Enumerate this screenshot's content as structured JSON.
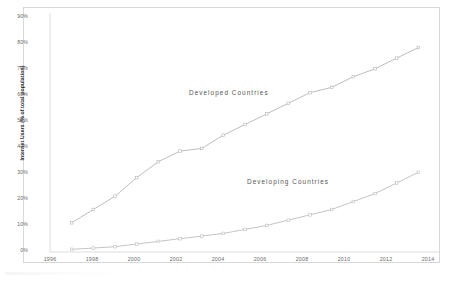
{
  "chart_data": {
    "type": "line",
    "title": "",
    "xlabel": "",
    "ylabel": "Internet Users (% of total population)",
    "xlim": [
      1996,
      2014
    ],
    "ylim": [
      0,
      90
    ],
    "grid": false,
    "legend_position": "inline-annotations",
    "xticks": [
      "1996",
      "1998",
      "2000",
      "2002",
      "2004",
      "2006",
      "2008",
      "2010",
      "2012",
      "2014"
    ],
    "yticks": [
      "0%",
      "10%",
      "20%",
      "30%",
      "40%",
      "50%",
      "60%",
      "70%",
      "80%",
      "90%"
    ],
    "x": [
      1997,
      1998,
      1999,
      2000,
      2001,
      2002,
      2003,
      2004,
      2005,
      2006,
      2007,
      2008,
      2009,
      2010,
      2011,
      2012,
      2013
    ],
    "series": [
      {
        "name": "Developed Countries",
        "color": "#b5b5b5",
        "values": [
          11,
          16,
          21,
          28,
          34,
          38,
          39,
          44,
          48,
          52,
          56,
          60,
          62,
          66,
          69,
          73,
          77
        ]
      },
      {
        "name": "Developing Countries",
        "color": "#bdbdbd",
        "values": [
          1,
          1.5,
          2,
          3,
          4,
          5,
          6,
          7,
          8.5,
          10,
          12,
          14,
          16,
          19,
          22,
          26,
          30
        ]
      }
    ],
    "annotations": [
      {
        "text": "Developed Countries",
        "x": 2003,
        "y": 62
      },
      {
        "text": "Developing Countries",
        "x": 2007,
        "y": 35
      }
    ]
  },
  "style": {
    "border_color": "#d8d8d8",
    "axis_color": "#cfcfcf",
    "tick_text_color": "#6a6a6a",
    "label_text_color": "#2b2b2b"
  }
}
